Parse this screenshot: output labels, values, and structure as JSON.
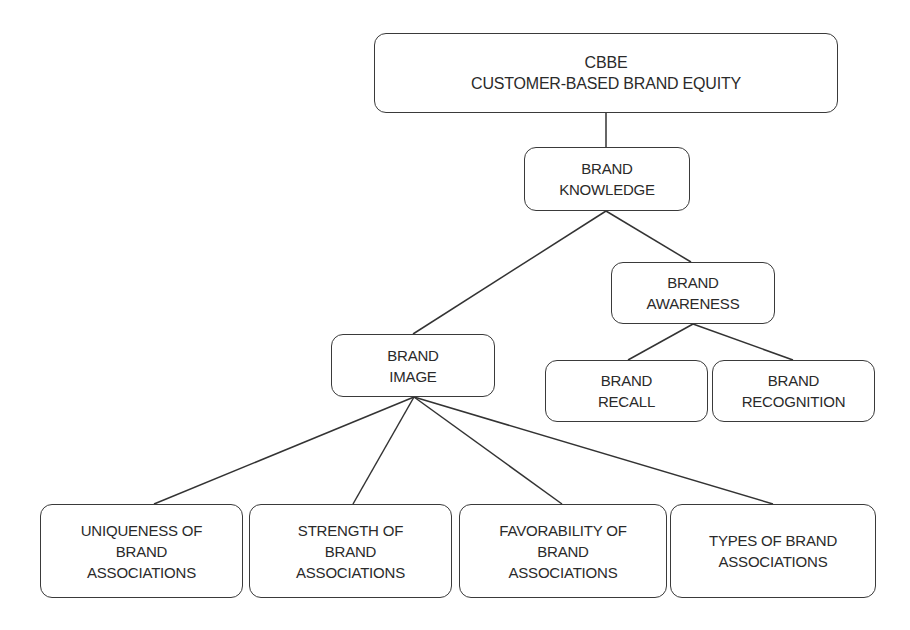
{
  "diagram": {
    "type": "hierarchy-tree",
    "nodes": [
      {
        "id": "cbbe",
        "lines": [
          "CBBE",
          "CUSTOMER-BASED BRAND EQUITY"
        ]
      },
      {
        "id": "brand_knowledge",
        "lines": [
          "BRAND",
          "KNOWLEDGE"
        ]
      },
      {
        "id": "brand_awareness",
        "lines": [
          "BRAND",
          "AWARENESS"
        ]
      },
      {
        "id": "brand_image",
        "lines": [
          "BRAND",
          "IMAGE"
        ]
      },
      {
        "id": "brand_recall",
        "lines": [
          "BRAND",
          "RECALL"
        ]
      },
      {
        "id": "brand_recognition",
        "lines": [
          "BRAND",
          "RECOGNITION"
        ]
      },
      {
        "id": "uniqueness",
        "lines": [
          "UNIQUENESS OF",
          "BRAND",
          "ASSOCIATIONS"
        ]
      },
      {
        "id": "strength",
        "lines": [
          "STRENGTH OF",
          "BRAND",
          "ASSOCIATIONS"
        ]
      },
      {
        "id": "favorability",
        "lines": [
          "FAVORABILITY OF",
          "BRAND",
          "ASSOCIATIONS"
        ]
      },
      {
        "id": "types",
        "lines": [
          "TYPES OF BRAND",
          "ASSOCIATIONS"
        ]
      }
    ],
    "edges": [
      [
        "cbbe",
        "brand_knowledge"
      ],
      [
        "brand_knowledge",
        "brand_image"
      ],
      [
        "brand_knowledge",
        "brand_awareness"
      ],
      [
        "brand_awareness",
        "brand_recall"
      ],
      [
        "brand_awareness",
        "brand_recognition"
      ],
      [
        "brand_image",
        "uniqueness"
      ],
      [
        "brand_image",
        "strength"
      ],
      [
        "brand_image",
        "favorability"
      ],
      [
        "brand_image",
        "types"
      ]
    ]
  }
}
